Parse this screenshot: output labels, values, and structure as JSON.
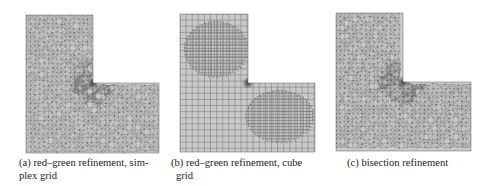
{
  "figure": {
    "panels": [
      {
        "id": "a",
        "label": "(a)",
        "caption_line1": "(a) red–green refinement, sim-",
        "caption_line2": "plex grid",
        "mesh_type": "simplex",
        "domain": {
          "left": 26,
          "top": 15,
          "corner_x": 93,
          "corner_y": 83,
          "right": 159,
          "bottom": 153
        }
      },
      {
        "id": "b",
        "label": "(b)",
        "caption_line1": "(b) red–green refinement, cube",
        "caption_line2": "grid",
        "mesh_type": "cube",
        "domain": {
          "left": 180,
          "top": 14,
          "corner_x": 248,
          "corner_y": 83,
          "right": 315,
          "bottom": 152
        }
      },
      {
        "id": "c",
        "label": "(c)",
        "caption_line1": "(c) bisection refinement",
        "caption_line2": "",
        "mesh_type": "bisection",
        "domain": {
          "left": 336,
          "top": 13,
          "corner_x": 403,
          "corner_y": 82,
          "right": 471,
          "bottom": 151
        }
      }
    ],
    "colors": {
      "fill": "#c9c9c9",
      "line": "#7a7a7a",
      "dark": "#3a3a3a"
    }
  }
}
